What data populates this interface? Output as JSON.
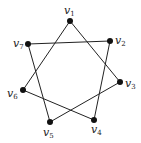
{
  "graph": {
    "title": "",
    "edge_color": "#222222",
    "vertex_color": "#111111",
    "vertices": [
      {
        "id": "v1",
        "base": "v",
        "sub": "1",
        "x": 70,
        "y": 21,
        "lx": 64,
        "ly": 14
      },
      {
        "id": "v2",
        "base": "v",
        "sub": "2",
        "x": 110,
        "y": 41,
        "lx": 115,
        "ly": 44
      },
      {
        "id": "v3",
        "base": "v",
        "sub": "3",
        "x": 120,
        "y": 82,
        "lx": 125,
        "ly": 87
      },
      {
        "id": "v4",
        "base": "v",
        "sub": "4",
        "x": 94,
        "y": 120,
        "lx": 91,
        "ly": 133
      },
      {
        "id": "v5",
        "base": "v",
        "sub": "5",
        "x": 50,
        "y": 122,
        "lx": 43,
        "ly": 136
      },
      {
        "id": "v6",
        "base": "v",
        "sub": "6",
        "x": 23,
        "y": 90,
        "lx": 7,
        "ly": 97
      },
      {
        "id": "v7",
        "base": "v",
        "sub": "7",
        "x": 28,
        "y": 44,
        "lx": 13,
        "ly": 47
      }
    ],
    "edges": [
      [
        "v1",
        "v3"
      ],
      [
        "v1",
        "v6"
      ],
      [
        "v7",
        "v2"
      ],
      [
        "v7",
        "v5"
      ],
      [
        "v2",
        "v4"
      ],
      [
        "v3",
        "v5"
      ],
      [
        "v6",
        "v4"
      ]
    ]
  }
}
